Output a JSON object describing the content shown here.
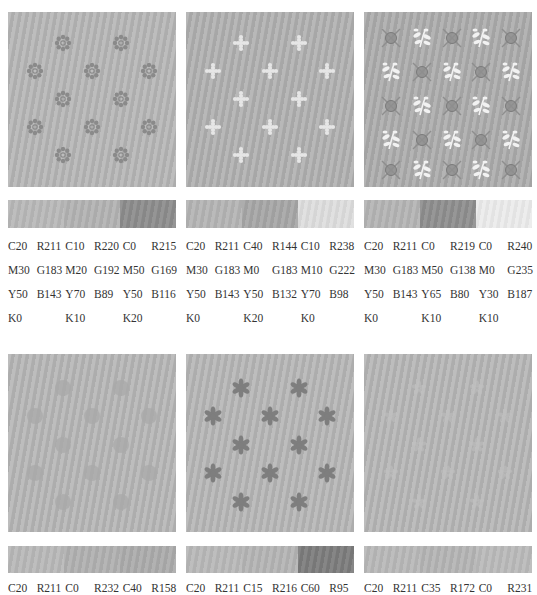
{
  "panels": [
    {
      "motif": "dotted-rosette",
      "motif_color": "#8a8a8a",
      "bg": "#b6b6b6",
      "bar_colors": [
        "#b8b8b8",
        "#b2b2b2",
        "#8c8c8c"
      ],
      "colors": [
        {
          "c": "C20",
          "m": "M30",
          "y": "Y50",
          "k": "K0",
          "r": "R211",
          "g": "G183",
          "b": "B143"
        },
        {
          "c": "C10",
          "m": "M20",
          "y": "Y70",
          "k": "K10",
          "r": "R220",
          "g": "G192",
          "b": "B89"
        },
        {
          "c": "C0",
          "m": "M50",
          "y": "Y50",
          "k": "K20",
          "r": "R215",
          "g": "G169",
          "b": "B116"
        }
      ]
    },
    {
      "motif": "cross-flower",
      "motif_color": "#e6e6e6",
      "bg": "#b0b0b0",
      "bar_colors": [
        "#b4b4b4",
        "#a6a6a6",
        "#dedede"
      ],
      "colors": [
        {
          "c": "C20",
          "m": "M30",
          "y": "Y50",
          "k": "K0",
          "r": "R211",
          "g": "G183",
          "b": "B143"
        },
        {
          "c": "C40",
          "m": "M0",
          "y": "Y50",
          "k": "K20",
          "r": "R144",
          "g": "G183",
          "b": "B132"
        },
        {
          "c": "C10",
          "m": "M10",
          "y": "Y70",
          "k": "K0",
          "r": "R238",
          "g": "G222",
          "b": "B98"
        }
      ]
    },
    {
      "motif": "leaf-and-crossed-circle",
      "motif_color": "#f2f2f2",
      "motif_color_2": "#8e8e8e",
      "bg": "#acacac",
      "bar_colors": [
        "#b4b4b4",
        "#8e8e8e",
        "#ececec"
      ],
      "colors": [
        {
          "c": "C20",
          "m": "M30",
          "y": "Y50",
          "k": "K0",
          "r": "R211",
          "g": "G183",
          "b": "B143"
        },
        {
          "c": "C0",
          "m": "M50",
          "y": "Y65",
          "k": "K10",
          "r": "R219",
          "g": "G138",
          "b": "B80"
        },
        {
          "c": "C0",
          "m": "M0",
          "y": "Y30",
          "k": "K10",
          "r": "R240",
          "g": "G235",
          "b": "B187"
        }
      ]
    },
    {
      "motif": "faint-rosette",
      "motif_color": "#a8a8a8",
      "bg": "#b6b6b6",
      "bar_colors": [
        "#b8b8b8",
        "#b0b0b0",
        "#ababab"
      ],
      "colors": [
        {
          "c": "C20",
          "r": "R211"
        },
        {
          "c": "C0",
          "r": "R232"
        },
        {
          "c": "C40",
          "r": "R158"
        }
      ]
    },
    {
      "motif": "six-petal-star",
      "motif_color": "#7e7e7e",
      "bg": "#b6b6b6",
      "bar_colors": [
        "#b8b8b8",
        "#b4b4b4",
        "#7c7c7c"
      ],
      "colors": [
        {
          "c": "C20",
          "r": "R211"
        },
        {
          "c": "C15",
          "r": "R216"
        },
        {
          "c": "C60",
          "r": "R95"
        }
      ]
    },
    {
      "motif": "faint-flower",
      "motif_color": "#c2c2c2",
      "bg": "#b6b6b6",
      "bar_colors": [
        "#b8b8b8",
        "#b4b4b4",
        "#bababa"
      ],
      "colors": [
        {
          "c": "C20",
          "r": "R211"
        },
        {
          "c": "C35",
          "r": "R172"
        },
        {
          "c": "C0",
          "r": "R231"
        }
      ]
    }
  ]
}
